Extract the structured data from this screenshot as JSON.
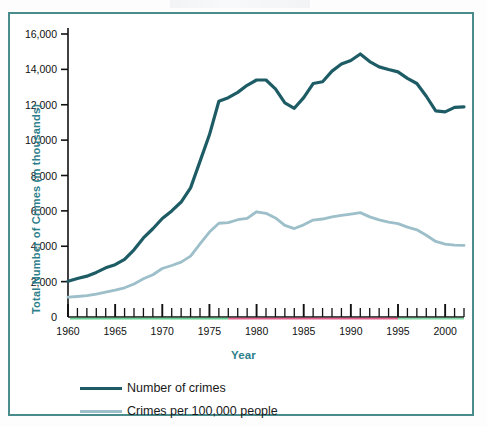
{
  "figure": {
    "frame_color": "#4a8c8c",
    "background": "#ffffff"
  },
  "axis_titles": {
    "y": "Total Number of Crimes (in thousands)",
    "x": "Year"
  },
  "legend": {
    "items": [
      {
        "label": "Number of crimes",
        "color": "#1d5c65"
      },
      {
        "label": "Crimes per 100,000 people",
        "color": "#9dbfc9"
      }
    ]
  },
  "chart_data": {
    "type": "line",
    "title": "",
    "subtitle": "",
    "xlabel": "Year",
    "ylabel": "Total Number of Crimes (in thousands)",
    "xlim": [
      1960,
      2002
    ],
    "ylim": [
      0,
      16000
    ],
    "grid": false,
    "legend_position": "bottom-left",
    "x_tick_labels": [
      "1960",
      "1965",
      "1970",
      "1975",
      "1980",
      "1985",
      "1990",
      "1995",
      "2000"
    ],
    "x_major_ticks": [
      1960,
      1965,
      1970,
      1975,
      1980,
      1985,
      1990,
      1995,
      2000
    ],
    "x_minor_tick_interval": 1,
    "y_tick_labels": [
      "0",
      "2,000",
      "4,000",
      "6,000",
      "8,000",
      "10,000",
      "12,000",
      "14,000",
      "16,000"
    ],
    "y_ticks": [
      0,
      2000,
      4000,
      6000,
      8000,
      10000,
      12000,
      14000,
      16000
    ],
    "x": [
      1960,
      1961,
      1962,
      1963,
      1964,
      1965,
      1966,
      1967,
      1968,
      1969,
      1970,
      1971,
      1972,
      1973,
      1974,
      1975,
      1976,
      1977,
      1978,
      1979,
      1980,
      1981,
      1982,
      1983,
      1984,
      1985,
      1986,
      1987,
      1988,
      1989,
      1990,
      1991,
      1992,
      1993,
      1994,
      1995,
      1996,
      1997,
      1998,
      1999,
      2000,
      2001,
      2002
    ],
    "series": [
      {
        "name": "Number of crimes",
        "color": "#1d5c65",
        "line_width": 3.2,
        "values": [
          2020,
          2180,
          2310,
          2520,
          2780,
          2960,
          3260,
          3800,
          4470,
          4990,
          5570,
          6000,
          6500,
          7300,
          8800,
          10300,
          12200,
          12400,
          12700,
          13100,
          13400,
          13400,
          12900,
          12100,
          11800,
          12400,
          13200,
          13300,
          13900,
          14300,
          14500,
          14870,
          14440,
          14140,
          13990,
          13860,
          13490,
          13200,
          12480,
          11650,
          11600,
          11850,
          11880
        ]
      },
      {
        "name": "Crimes per 100,000 people",
        "color": "#9dbfc9",
        "line_width": 2.8,
        "values": [
          1120,
          1160,
          1210,
          1290,
          1410,
          1520,
          1650,
          1870,
          2160,
          2390,
          2740,
          2910,
          3100,
          3440,
          4130,
          4800,
          5300,
          5340,
          5500,
          5570,
          5950,
          5860,
          5600,
          5180,
          5000,
          5210,
          5480,
          5540,
          5660,
          5740,
          5820,
          5900,
          5660,
          5490,
          5370,
          5280,
          5080,
          4930,
          4620,
          4270,
          4120,
          4060,
          4050
        ]
      }
    ]
  }
}
